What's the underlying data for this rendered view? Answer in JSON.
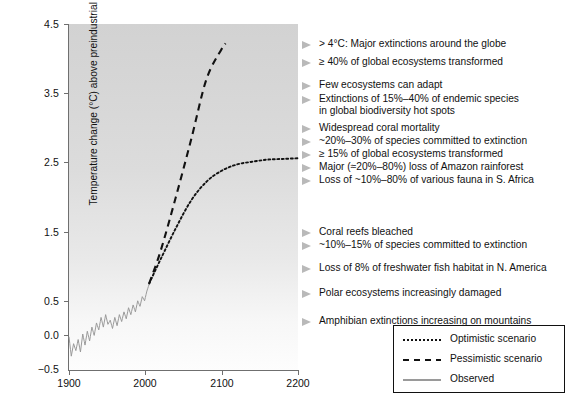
{
  "chart_data": {
    "type": "line",
    "title": "",
    "xlabel": "",
    "ylabel": "Temperature change (°C) above preindustrial",
    "xlim": [
      1900,
      2200
    ],
    "ylim": [
      -0.5,
      4.5
    ],
    "xticks": [
      1900,
      2000,
      2100,
      2200
    ],
    "xticklabels": [
      "1900",
      "2000",
      "2100",
      "2200"
    ],
    "yticks": [
      -0.5,
      0.0,
      0.5,
      1.5,
      2.5,
      3.5,
      4.5
    ],
    "yticklabels": [
      "−0.5",
      "0.0",
      "0.5",
      "1.5",
      "2.5",
      "3.5",
      "4.5"
    ],
    "grid": false,
    "legend_position": "bottom-right",
    "background": "vertical gradient light-gray (top) to white (bottom)",
    "series": [
      {
        "name": "Observed",
        "style": "solid",
        "color": "#9a9a9a",
        "x": [
          1900,
          1903,
          1906,
          1909,
          1912,
          1915,
          1918,
          1921,
          1924,
          1927,
          1930,
          1933,
          1936,
          1939,
          1942,
          1945,
          1948,
          1951,
          1954,
          1957,
          1960,
          1963,
          1966,
          1969,
          1972,
          1975,
          1978,
          1981,
          1984,
          1987,
          1990,
          1993,
          1996,
          1999,
          2002,
          2005
        ],
        "y": [
          -0.02,
          -0.3,
          -0.12,
          -0.22,
          -0.06,
          -0.24,
          0.02,
          -0.14,
          0.06,
          -0.08,
          0.12,
          0.0,
          0.18,
          0.08,
          0.26,
          0.12,
          0.3,
          0.16,
          0.22,
          0.1,
          0.26,
          0.14,
          0.3,
          0.2,
          0.34,
          0.24,
          0.4,
          0.3,
          0.44,
          0.34,
          0.5,
          0.42,
          0.56,
          0.5,
          0.64,
          0.74
        ]
      },
      {
        "name": "Optimistic scenario",
        "style": "dotted",
        "color": "#111111",
        "x": [
          2005,
          2020,
          2040,
          2060,
          2080,
          2100,
          2120,
          2140,
          2160,
          2180,
          2200
        ],
        "y": [
          0.75,
          1.1,
          1.55,
          1.95,
          2.22,
          2.38,
          2.47,
          2.51,
          2.54,
          2.55,
          2.56
        ]
      },
      {
        "name": "Pessimistic scenario",
        "style": "dashed",
        "color": "#111111",
        "x": [
          2005,
          2020,
          2040,
          2060,
          2080,
          2100,
          2105
        ],
        "y": [
          0.75,
          1.22,
          2.0,
          2.83,
          3.7,
          4.14,
          4.22
        ]
      }
    ],
    "annotations": [
      {
        "y_value": 4.2,
        "text": "> 4°C: Major extinctions around the globe"
      },
      {
        "y_value": 3.95,
        "text": "≥ 40% of global ecosystems transformed"
      },
      {
        "y_value": 3.62,
        "text": "Few ecosystems can adapt"
      },
      {
        "y_value": 3.42,
        "text": "Extinctions of 15%–40% of endemic species\nin global biodiversity hot spots"
      },
      {
        "y_value": 3.03,
        "text": "Widespread coral mortality"
      },
      {
        "y_value": 2.85,
        "text": "~20%–30% of species committed to extinction"
      },
      {
        "y_value": 2.66,
        "text": "≥ 15% of global ecosystems transformed"
      },
      {
        "y_value": 2.48,
        "text": "Major (≈20%–80%) loss of Amazon rainforest"
      },
      {
        "y_value": 2.3,
        "text": "Loss of ~10%–80% of various fauna in S. Africa"
      },
      {
        "y_value": 1.62,
        "text": "Coral reefs bleached"
      },
      {
        "y_value": 1.44,
        "text": "~10%–15% of species committed to extinction"
      },
      {
        "y_value": 1.18,
        "text": "Loss of 8% of freshwater fish habitat in N. America"
      },
      {
        "y_value": 0.88,
        "text": "Polar ecosystems increasingly damaged"
      },
      {
        "y_value": 0.55,
        "text": "Amphibian extinctions increasing on mountains"
      }
    ]
  },
  "axis": {
    "y_title": "Temperature change (°C) above preindustrial",
    "y_labels": [
      "4.5",
      "3.5",
      "2.5",
      "1.5",
      "0.5",
      "0.0",
      "−0.5"
    ],
    "x_labels": [
      "1900",
      "2000",
      "2100",
      "2200"
    ]
  },
  "annotations": [
    {
      "text": "> 4°C: Major extinctions around the globe",
      "top": 40
    },
    {
      "text": "≥ 40% of global ecosystems transformed",
      "top": 58
    },
    {
      "text": "Few ecosystems can adapt",
      "top": 81
    },
    {
      "text": "Extinctions of 15%–40% of endemic species",
      "top": 95
    },
    {
      "text": "in global biodiversity hot spots",
      "top": 107
    },
    {
      "text": "Widespread coral mortality",
      "top": 124
    },
    {
      "text": "~20%–30% of species committed to extinction",
      "top": 137
    },
    {
      "text": "≥ 15% of global ecosystems transformed",
      "top": 150
    },
    {
      "text": "Major (≈20%–80%) loss of Amazon rainforest",
      "top": 163
    },
    {
      "text": "Loss of ~10%–80% of various fauna in S. Africa",
      "top": 176
    },
    {
      "text": "Coral reefs bleached",
      "top": 228
    },
    {
      "text": "~10%–15% of species committed to extinction",
      "top": 241
    },
    {
      "text": "Loss of 8% of freshwater fish habitat in N. America",
      "top": 264
    },
    {
      "text": "Polar ecosystems increasingly damaged",
      "top": 289
    },
    {
      "text": "Amphibian extinctions increasing on mountains",
      "top": 317
    }
  ],
  "legend": {
    "items": [
      {
        "label": "Optimistic scenario",
        "style": "dotted",
        "color": "#111111"
      },
      {
        "label": "Pessimistic scenario",
        "style": "dashed",
        "color": "#111111"
      },
      {
        "label": "Observed",
        "style": "solid",
        "color": "#9a9a9a"
      }
    ]
  }
}
